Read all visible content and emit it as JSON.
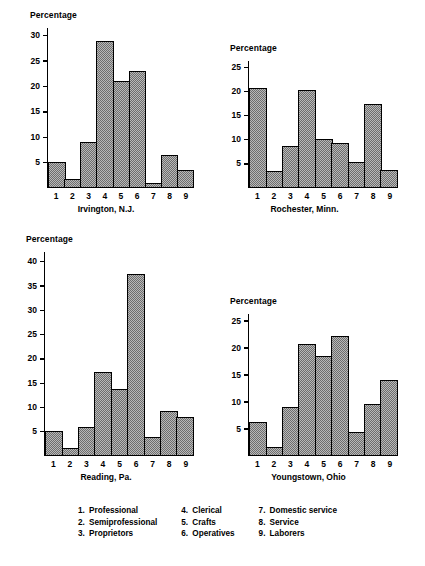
{
  "figure": {
    "axis_label": "Percentage",
    "categories": [
      "1",
      "2",
      "3",
      "4",
      "5",
      "6",
      "7",
      "8",
      "9"
    ]
  },
  "charts": [
    {
      "id": "irvington",
      "caption": "Irvington, N.J.",
      "ylabel": "Percentage",
      "yticks": [
        "5",
        "10",
        "15",
        "20",
        "25",
        "30"
      ],
      "ymax": 31.5,
      "values": [
        4.8,
        1.5,
        8.8,
        29.0,
        21.0,
        23.0,
        0.7,
        6.3,
        3.4
      ]
    },
    {
      "id": "rochester",
      "caption": "Rochester, Minn.",
      "ylabel": "Percentage",
      "yticks": [
        "5",
        "10",
        "15",
        "20",
        "25"
      ],
      "ymax": 26.3,
      "values": [
        20.7,
        3.3,
        8.5,
        20.2,
        9.9,
        9.1,
        5.1,
        17.2,
        3.5
      ]
    },
    {
      "id": "reading",
      "caption": "Reading, Pa.",
      "ylabel": "Percentage",
      "yticks": [
        "5",
        "10",
        "15",
        "20",
        "25",
        "30",
        "35",
        "40"
      ],
      "ymax": 42.0,
      "values": [
        4.8,
        1.3,
        5.7,
        17.2,
        13.7,
        37.4,
        3.6,
        9.0,
        7.9
      ]
    },
    {
      "id": "youngstown",
      "caption": "Youngstown, Ohio",
      "ylabel": "Percentage",
      "yticks": [
        "5",
        "10",
        "15",
        "20",
        "25"
      ],
      "ymax": 26.3,
      "values": [
        6.1,
        1.4,
        8.9,
        20.7,
        18.5,
        22.2,
        4.2,
        9.4,
        14.0
      ]
    }
  ],
  "legend": {
    "columns": [
      [
        {
          "num": "1.",
          "label": "Professional"
        },
        {
          "num": "2.",
          "label": "Semiprofessional"
        },
        {
          "num": "3.",
          "label": "Proprietors"
        }
      ],
      [
        {
          "num": "4.",
          "label": "Clerical"
        },
        {
          "num": "5.",
          "label": "Crafts"
        },
        {
          "num": "6.",
          "label": "Operatives"
        }
      ],
      [
        {
          "num": "7.",
          "label": "Domestic service"
        },
        {
          "num": "8.",
          "label": "Service"
        },
        {
          "num": "9.",
          "label": "Laborers"
        }
      ]
    ]
  },
  "chart_data": [
    {
      "type": "bar",
      "title": "Irvington, N.J.",
      "xlabel": "",
      "ylabel": "Percentage",
      "categories": [
        "1",
        "2",
        "3",
        "4",
        "5",
        "6",
        "7",
        "8",
        "9"
      ],
      "category_names": [
        "Professional",
        "Semiprofessional",
        "Proprietors",
        "Clerical",
        "Crafts",
        "Operatives",
        "Domestic service",
        "Service",
        "Laborers"
      ],
      "values": [
        4.8,
        1.5,
        8.8,
        29.0,
        21.0,
        23.0,
        0.7,
        6.3,
        3.4
      ],
      "ylim": [
        0,
        31.5
      ],
      "yticks": [
        5,
        10,
        15,
        20,
        25,
        30
      ],
      "grid": false,
      "legend": "none"
    },
    {
      "type": "bar",
      "title": "Rochester, Minn.",
      "xlabel": "",
      "ylabel": "Percentage",
      "categories": [
        "1",
        "2",
        "3",
        "4",
        "5",
        "6",
        "7",
        "8",
        "9"
      ],
      "category_names": [
        "Professional",
        "Semiprofessional",
        "Proprietors",
        "Clerical",
        "Crafts",
        "Operatives",
        "Domestic service",
        "Service",
        "Laborers"
      ],
      "values": [
        20.7,
        3.3,
        8.5,
        20.2,
        9.9,
        9.1,
        5.1,
        17.2,
        3.5
      ],
      "ylim": [
        0,
        26.3
      ],
      "yticks": [
        5,
        10,
        15,
        20,
        25
      ],
      "grid": false,
      "legend": "none"
    },
    {
      "type": "bar",
      "title": "Reading, Pa.",
      "xlabel": "",
      "ylabel": "Percentage",
      "categories": [
        "1",
        "2",
        "3",
        "4",
        "5",
        "6",
        "7",
        "8",
        "9"
      ],
      "category_names": [
        "Professional",
        "Semiprofessional",
        "Proprietors",
        "Clerical",
        "Crafts",
        "Operatives",
        "Domestic service",
        "Service",
        "Laborers"
      ],
      "values": [
        4.8,
        1.3,
        5.7,
        17.2,
        13.7,
        37.4,
        3.6,
        9.0,
        7.9
      ],
      "ylim": [
        0,
        42.0
      ],
      "yticks": [
        5,
        10,
        15,
        20,
        25,
        30,
        35,
        40
      ],
      "grid": false,
      "legend": "none"
    },
    {
      "type": "bar",
      "title": "Youngstown, Ohio",
      "xlabel": "",
      "ylabel": "Percentage",
      "categories": [
        "1",
        "2",
        "3",
        "4",
        "5",
        "6",
        "7",
        "8",
        "9"
      ],
      "category_names": [
        "Professional",
        "Semiprofessional",
        "Proprietors",
        "Clerical",
        "Crafts",
        "Operatives",
        "Domestic service",
        "Service",
        "Laborers"
      ],
      "values": [
        6.1,
        1.4,
        8.9,
        20.7,
        18.5,
        22.2,
        4.2,
        9.4,
        14.0
      ],
      "ylim": [
        0,
        26.3
      ],
      "yticks": [
        5,
        10,
        15,
        20,
        25
      ],
      "grid": false,
      "legend": "none"
    }
  ]
}
